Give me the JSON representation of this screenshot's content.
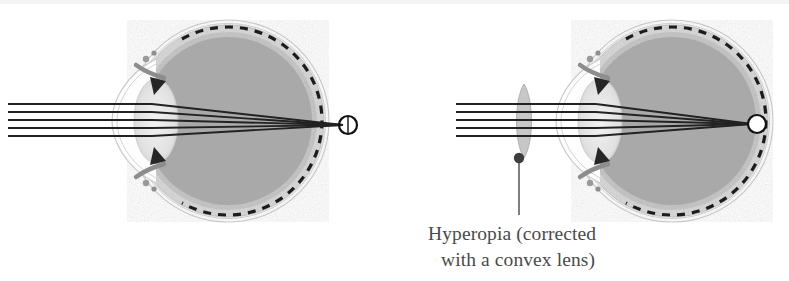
{
  "figure": {
    "panels": [
      {
        "id": "uncorrected",
        "name": "hyperopic-eye-uncorrected",
        "caption": "",
        "focal_point_label": "focal point behind retina",
        "ray_count": 5,
        "has_corrective_lens": false
      },
      {
        "id": "corrected",
        "name": "hyperopic-eye-corrected",
        "caption_line_1": "Hyperopia (corrected",
        "caption_line_2": "with a convex lens)",
        "focal_point_label": "focal point on retina",
        "ray_count": 5,
        "has_corrective_lens": true,
        "lens_type": "convex"
      }
    ],
    "parts": [
      "cornea",
      "crystalline-lens",
      "iris",
      "ciliary-body",
      "sclera",
      "retina",
      "vitreous-body",
      "optic-nerve-head"
    ]
  },
  "colors": {
    "background": "#ffffff",
    "vitreous": "#a9a9a9",
    "sclera": "#d2d2d2",
    "outline": "#b9b9b9",
    "retina_dash": "#1a1a1a",
    "ray": "#222222",
    "lens_fill": "#bdbdbd",
    "caption_text": "#4a4a4a",
    "leader_line": "#555555",
    "iris_dark": "#2b2b2b",
    "crystalline_lens": "#e6e6e6"
  },
  "geometry": {
    "left_eye": {
      "center_x": 228,
      "center_y": 121,
      "radius": 100,
      "focal_x": 348,
      "focal_y": 125,
      "focal_r": 9
    },
    "right_eye": {
      "center_x": 672,
      "center_y": 121,
      "radius": 100,
      "focal_x": 757,
      "focal_y": 124,
      "focal_r": 9
    },
    "rays_y": [
      104,
      112,
      120,
      128,
      136
    ],
    "corrective_lens": {
      "x": 524,
      "top_y": 84,
      "bottom_y": 158,
      "half_width": 7
    },
    "leader": {
      "dot_x": 519,
      "dot_y": 158,
      "dot_r": 5,
      "line_bottom_y": 215
    },
    "caption": {
      "line1_x": 428,
      "line1_y": 240,
      "line2_x": 441,
      "line2_y": 266
    }
  }
}
